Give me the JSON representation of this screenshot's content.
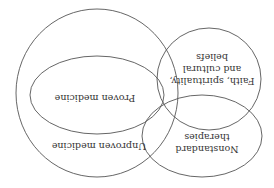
{
  "diagram": {
    "orientation": "rotated 180 degrees",
    "stroke_color": "#555555",
    "text_color": "#333333",
    "sets": [
      {
        "id": "unproven",
        "label": "Unproven medicine",
        "shape": "circle",
        "cx": 97,
        "cy": 93,
        "rx": 81,
        "ry": 84
      },
      {
        "id": "proven",
        "label": "Proven medicine",
        "shape": "ellipse",
        "cx": 97,
        "cy": 95,
        "rx": 67,
        "ry": 39
      },
      {
        "id": "faith",
        "label_lines": [
          "Faith, spirituality,",
          "and cultural",
          "beliefs"
        ],
        "shape": "circle",
        "cx": 209,
        "cy": 79,
        "rx": 52,
        "ry": 51
      },
      {
        "id": "nonstandard",
        "label_lines": [
          "Nonstandard",
          "therapies"
        ],
        "shape": "ellipse",
        "cx": 202,
        "cy": 136,
        "rx": 60,
        "ry": 41
      }
    ],
    "labels": {
      "unproven": "Unproven medicine",
      "proven": "Proven medicine",
      "faith_1": "Faith, spirituality,",
      "faith_2": "and cultural",
      "faith_3": "beliefs",
      "nonstandard_1": "Nonstandard",
      "nonstandard_2": "therapies"
    }
  }
}
